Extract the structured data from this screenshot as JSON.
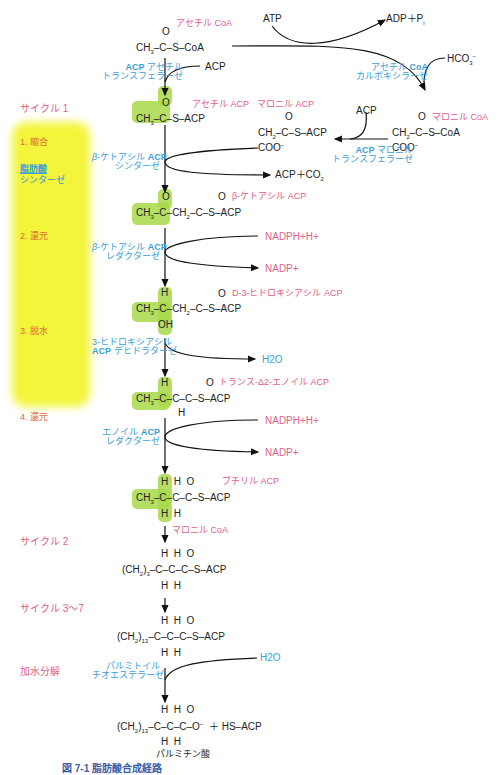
{
  "figure": {
    "caption": "図 7-1 脂肪酸合成経路",
    "top": {
      "acetyl_coa_label": "アセチル CoA",
      "acetyl_coa_formula": "CH3-C(=O)-S-CoA",
      "atp": "ATP",
      "adp_pi": "ADP+Pi",
      "hco3": "HCO3-",
      "enzyme_acp_acetyl_transferase": [
        "ACP アセチル",
        "トランスフェラーゼ"
      ],
      "enzyme_acetyl_coa_carboxylase": [
        "アセチル CoA",
        "カルボキシラーゼ"
      ],
      "acp_in": "ACP"
    },
    "malonyl": {
      "malonyl_coa_label": "マロニル CoA",
      "malonyl_acp_label": "マロニル ACP",
      "acp_in": "ACP",
      "enzyme_acp_malonyl_transferase": [
        "ACP マロニル",
        "トランスフェラーゼ"
      ]
    },
    "cycle1": {
      "title": "サイクル 1",
      "steps": [
        {
          "label": "1. 縮合",
          "enzyme": [
            "β-ケトアシル ACP",
            "シンターゼ"
          ],
          "product_label": "アセチル ACP",
          "outputs": [
            "ACP+CO2"
          ]
        },
        {
          "label": "2. 還元",
          "enzyme": [
            "β-ケトアシル ACP",
            "レダクターゼ"
          ],
          "product_label": "β-ケトアシル ACP",
          "inputs": [
            "NADPH+H+"
          ],
          "outputs": [
            "NADP+"
          ]
        },
        {
          "label": "3. 脱水",
          "enzyme": [
            "3-ヒドロキシアシル",
            "ACP デヒドラターゼ"
          ],
          "product_label": "D-3-ヒドロキシアシル ACP",
          "outputs": [
            "H2O"
          ]
        },
        {
          "label": "4. 還元",
          "enzyme": [
            "エノイル ACP",
            "レダクターゼ"
          ],
          "product_label": "トランス-Δ2-エノイル ACP",
          "inputs": [
            "NADPH+H+"
          ],
          "outputs": [
            "NADP+"
          ]
        }
      ],
      "fatty_acid_synthase": [
        "脂肪酸",
        "シンターゼ"
      ],
      "final_label": "ブチリル ACP"
    },
    "cycle2": {
      "title": "サイクル 2",
      "input": "マロニル CoA",
      "formula_prefix": "(CH2)3"
    },
    "cycle3_7": {
      "title": "サイクル 3～7",
      "formula_prefix": "(CH2)13"
    },
    "hydrolysis": {
      "title": "加水分解",
      "enzyme": [
        "パルミトイル",
        "チオエステラーゼ"
      ],
      "input": "H2O",
      "formula_prefix": "(CH2)13",
      "product_tail": "+ HS-ACP",
      "product_name": "パルミチン酸"
    }
  }
}
